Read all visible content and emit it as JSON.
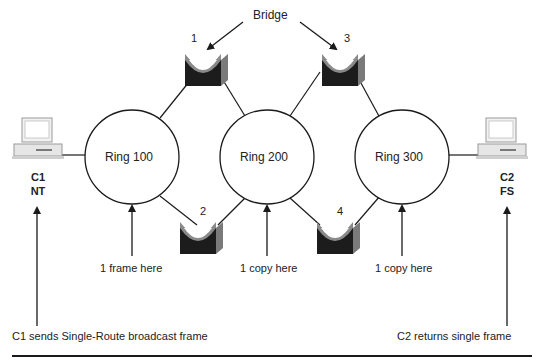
{
  "diagram": {
    "bridge_label": "Bridge",
    "bridges": [
      {
        "id": "1",
        "label": "1"
      },
      {
        "id": "2",
        "label": "2"
      },
      {
        "id": "3",
        "label": "3"
      },
      {
        "id": "4",
        "label": "4"
      }
    ],
    "rings": [
      {
        "label": "Ring 100",
        "note": "1 frame here"
      },
      {
        "label": "Ring 200",
        "note": "1 copy here"
      },
      {
        "label": "Ring 300",
        "note": "1 copy here"
      }
    ],
    "hosts": [
      {
        "name": "C1",
        "os": "NT",
        "caption": "C1 sends Single-Route broadcast frame"
      },
      {
        "name": "C2",
        "os": "FS",
        "caption": "C2 returns single frame"
      }
    ],
    "colors": {
      "line": "#1a1a1a",
      "bridge_dark": "#1c1c1c",
      "bridge_gray": "#8a8a8a",
      "pc": "#e6e6e6"
    }
  }
}
